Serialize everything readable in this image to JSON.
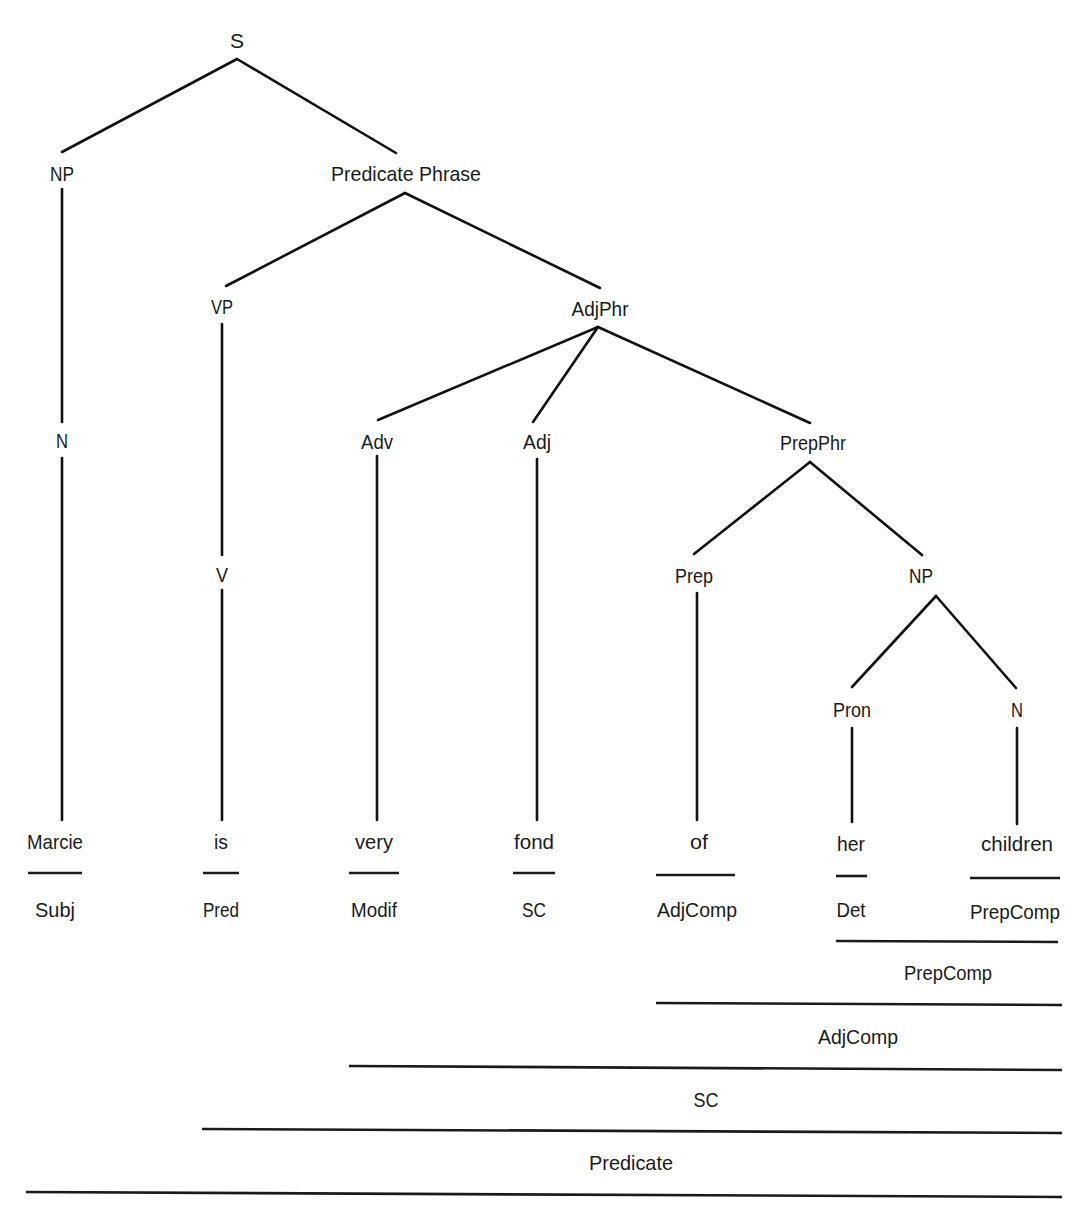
{
  "diagram": {
    "type": "syntax-tree",
    "sentence": "Marcie is very fond of her children",
    "nodes": {
      "S": "S",
      "NP": "NP",
      "PredPhrase": "Predicate Phrase",
      "VP": "VP",
      "AdjPhr": "AdjPhr",
      "N1": "N",
      "V": "V",
      "Adv": "Adv",
      "Adj": "Adj",
      "PrepPhr": "PrepPhr",
      "Prep": "Prep",
      "NP2": "NP",
      "Pron": "Pron",
      "N2": "N"
    },
    "words": [
      "Marcie",
      "is",
      "very",
      "fond",
      "of",
      "her",
      "children"
    ],
    "functions": [
      "Subj",
      "Pred",
      "Modif",
      "SC",
      "AdjComp",
      "Det",
      "PrepComp"
    ],
    "spans": [
      {
        "label": "PrepComp",
        "from": "her",
        "to": "children"
      },
      {
        "label": "AdjComp",
        "from": "of",
        "to": "children"
      },
      {
        "label": "SC",
        "from": "very",
        "to": "children"
      },
      {
        "label": "Predicate",
        "from": "is",
        "to": "children"
      }
    ]
  }
}
